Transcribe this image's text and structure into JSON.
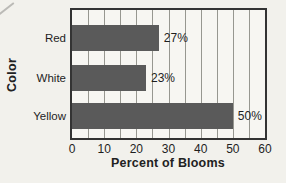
{
  "chart_data": {
    "type": "bar",
    "orientation": "horizontal",
    "categories": [
      "Red",
      "White",
      "Yellow"
    ],
    "values": [
      27,
      23,
      50
    ],
    "value_labels": [
      "27%",
      "23%",
      "50%"
    ],
    "xlabel": "Percent of Blooms",
    "ylabel": "Color",
    "xlim": [
      0,
      60
    ],
    "xticks": [
      0,
      10,
      20,
      30,
      40,
      50,
      60
    ],
    "grid_interval": 5,
    "grid": "on",
    "legend": "none",
    "bar_color": "#5a5a5a",
    "plot_bg": "#f7f6f2",
    "page_bg": "#f2f1ec",
    "border_color": "#333333",
    "grid_color": "#979790",
    "text_color": "#1e1e1e"
  }
}
